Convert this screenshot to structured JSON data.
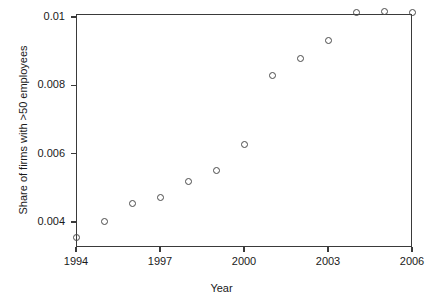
{
  "chart_data": {
    "type": "scatter",
    "title": "",
    "xlabel": "Year",
    "ylabel": "Share of firms with >50 employees",
    "xlim": [
      1994,
      2006
    ],
    "ylim": [
      0.0034,
      0.01045
    ],
    "grid": false,
    "legend": null,
    "xticks": [
      1994,
      1997,
      2000,
      2003,
      2006
    ],
    "xtick_labels": [
      "1994",
      "1997",
      "2000",
      "2003",
      "2006"
    ],
    "yticks": [
      0.004,
      0.006,
      0.008,
      0.01
    ],
    "ytick_labels": [
      "0.004",
      "0.006",
      "0.008",
      "0.01"
    ],
    "marker": "open-circle",
    "marker_color": "#4a4a4a",
    "x": [
      1994,
      1995,
      1996,
      1997,
      1998,
      1999,
      2000,
      2001,
      2002,
      2003,
      2004,
      2005,
      2006
    ],
    "y": [
      0.00355,
      0.00401,
      0.00455,
      0.00473,
      0.00518,
      0.00551,
      0.00628,
      0.00828,
      0.00879,
      0.00932,
      0.01012,
      0.01015,
      0.01014
    ],
    "points": [
      {
        "year": "1994",
        "value": "0.00355"
      },
      {
        "year": "1995",
        "value": "0.00401"
      },
      {
        "year": "1996",
        "value": "0.00455"
      },
      {
        "year": "1997",
        "value": "0.00473"
      },
      {
        "year": "1998",
        "value": "0.00518"
      },
      {
        "year": "1999",
        "value": "0.00551"
      },
      {
        "year": "2000",
        "value": "0.00628"
      },
      {
        "year": "2001",
        "value": "0.00828"
      },
      {
        "year": "2002",
        "value": "0.00879"
      },
      {
        "year": "2003",
        "value": "0.00932"
      },
      {
        "year": "2004",
        "value": "0.01012"
      },
      {
        "year": "2005",
        "value": "0.01015"
      },
      {
        "year": "2006",
        "value": "0.01014"
      }
    ]
  }
}
